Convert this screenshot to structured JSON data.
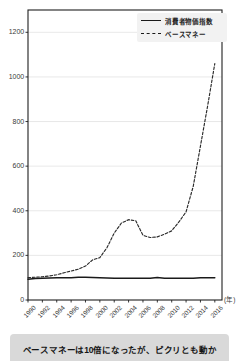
{
  "chart_data": {
    "type": "line",
    "title": "",
    "xlabel": "(年)",
    "ylabel": "",
    "xlim": [
      1990,
      2017
    ],
    "ylim": [
      0,
      1300
    ],
    "yticks": [
      0,
      200,
      400,
      600,
      800,
      1000,
      1200
    ],
    "xticks": [
      "1990",
      "1992",
      "1994",
      "1996",
      "1998",
      "2000",
      "2002",
      "2004",
      "2006",
      "2008",
      "2010",
      "2012",
      "2014",
      "2016"
    ],
    "grid": true,
    "legend_position": "top-right",
    "series": [
      {
        "name": "消費者物価指数",
        "style": "solid",
        "color": "#1a1a1a",
        "x": [
          1990,
          1991,
          1992,
          1993,
          1994,
          1995,
          1996,
          1997,
          1998,
          1999,
          2000,
          2001,
          2002,
          2003,
          2004,
          2005,
          2006,
          2007,
          2008,
          2009,
          2010,
          2011,
          2012,
          2013,
          2014,
          2015,
          2016
        ],
        "values": [
          93,
          96,
          98,
          99,
          100,
          100,
          100,
          102,
          102,
          101,
          100,
          99,
          98,
          98,
          98,
          97,
          97,
          97,
          101,
          98,
          97,
          97,
          97,
          97,
          100,
          100,
          100
        ]
      },
      {
        "name": "ベースマネー",
        "style": "dashed",
        "color": "#2a2a2a",
        "x": [
          1990,
          1991,
          1992,
          1993,
          1994,
          1995,
          1996,
          1997,
          1998,
          1999,
          2000,
          2001,
          2002,
          2003,
          2004,
          2005,
          2006,
          2007,
          2008,
          2009,
          2010,
          2011,
          2012,
          2013,
          2014,
          2015,
          2016
        ],
        "values": [
          100,
          102,
          104,
          108,
          113,
          122,
          130,
          138,
          152,
          180,
          190,
          235,
          300,
          345,
          360,
          355,
          290,
          280,
          283,
          295,
          310,
          350,
          395,
          510,
          690,
          870,
          1060
        ]
      }
    ],
    "annotations": []
  },
  "legend": {
    "items": [
      {
        "label": "消費者物価指数",
        "style": "solid"
      },
      {
        "label": "ベースマネー",
        "style": "dashed"
      }
    ]
  },
  "axis": {
    "x_unit": "(年)"
  },
  "caption": {
    "text": "ベースマネーは10倍になったが、ピクリとも動か"
  }
}
